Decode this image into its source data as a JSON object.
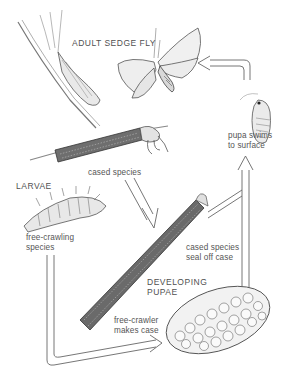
{
  "diagram": {
    "stages": {
      "adult": {
        "label": "ADULT SEDGE FLY"
      },
      "larvae": {
        "label": "LARVAE"
      },
      "pupae": {
        "label_line1": "DEVELOPING",
        "label_line2": "PUPAE"
      }
    },
    "annotations": {
      "cased_species": "cased species",
      "free_crawling_line1": "free-crawling",
      "free_crawling_line2": "species",
      "cased_seal_line1": "cased species",
      "cased_seal_line2": "seal off case",
      "free_crawler_line1": "free-crawler",
      "free_crawler_line2": "makes case",
      "pupa_swims_line1": "pupa swims",
      "pupa_swims_line2": "to surface"
    },
    "colors": {
      "ink": "#4a4a4a",
      "text": "#555555",
      "background": "#ffffff"
    }
  }
}
